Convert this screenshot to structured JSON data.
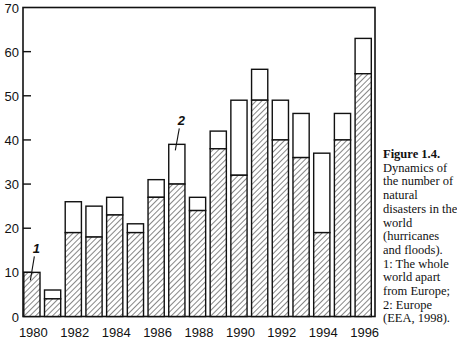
{
  "chart_data": {
    "type": "bar",
    "stacked": true,
    "title": "",
    "xlabel": "",
    "ylabel": "",
    "ylim": [
      0,
      70
    ],
    "yticks": [
      0,
      10,
      20,
      30,
      40,
      50,
      60,
      70
    ],
    "xtick_labels": [
      "1980",
      "1982",
      "1984",
      "1986",
      "1988",
      "1990",
      "1992",
      "1994",
      "1996"
    ],
    "grid": false,
    "categories": [
      "1980",
      "1981",
      "1982",
      "1983",
      "1984",
      "1985",
      "1986",
      "1987",
      "1988",
      "1989",
      "1990",
      "1991",
      "1992",
      "1993",
      "1994",
      "1995",
      "1996"
    ],
    "series": [
      {
        "name": "1: The whole world apart from Europe",
        "pattern": "hatched",
        "values": [
          10,
          4,
          19,
          18,
          23,
          19,
          27,
          30,
          24,
          38,
          32,
          49,
          40,
          36,
          19,
          40,
          55
        ]
      },
      {
        "name": "2: Europe",
        "pattern": "white",
        "values": [
          0,
          2,
          7,
          7,
          4,
          2,
          4,
          9,
          3,
          4,
          17,
          7,
          9,
          10,
          18,
          6,
          8
        ]
      }
    ],
    "totals": [
      10,
      6,
      26,
      25,
      27,
      21,
      31,
      39,
      27,
      42,
      49,
      56,
      49,
      46,
      37,
      46,
      63
    ],
    "annotations": [
      {
        "text": "1",
        "category": "1980",
        "target": "hatched"
      },
      {
        "text": "2",
        "category": "1987",
        "target": "white"
      }
    ]
  },
  "caption": {
    "title": "Figure 1.4.",
    "lines": [
      "Dynamics of",
      "the number of",
      "natural",
      "disasters in the",
      "world",
      "(hurricanes",
      "and floods).",
      "1: The whole",
      "world apart",
      "from Europe;",
      "2: Europe",
      "(EEA, 1998)."
    ]
  }
}
